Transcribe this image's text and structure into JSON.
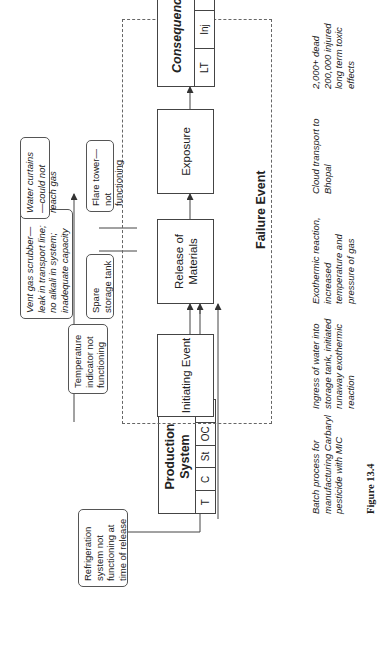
{
  "diagram": {
    "production_system": {
      "title": "Production System",
      "cells": [
        "T",
        "C",
        "St",
        "OC",
        "Sc"
      ],
      "description": "Batch process for manufacturing Carbaryl pesticide with MIC"
    },
    "failure_event": {
      "label": "Failure Event",
      "steps": [
        {
          "label": "Initiating Event",
          "description": "Ingress of water into storage tank, initiated runaway exothermic reaction"
        },
        {
          "label": "Release of Materials",
          "description": "Exothermic reaction, increased temperature and pressure of gas"
        },
        {
          "label": "Exposure",
          "description": "Cloud transport to Bhopal"
        }
      ]
    },
    "consequences": {
      "title": "Consequences",
      "cells": [
        "LT",
        "Inj",
        "PD"
      ],
      "description": "2,000+ dead 200,000 injured long term toxic effects"
    },
    "contributing_factors": [
      {
        "text": "Refrigeration system not functioning at time of release",
        "italic": false
      },
      {
        "text": "Temperature indicator not functioning",
        "italic": false
      },
      {
        "text": "Vent gas scrubber—leak in transport line; no alkali in system; inadequate capacity",
        "italic": true
      },
      {
        "text": "Spare storage tank",
        "italic": false
      },
      {
        "text": "Water curtains—could not reach gas",
        "italic": true
      },
      {
        "text": "Flare tower—not functioning",
        "italic": false
      }
    ],
    "figure_label": "Figure 13.4"
  }
}
